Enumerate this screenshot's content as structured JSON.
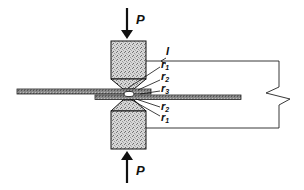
{
  "diagram": {
    "force_top_label": "P",
    "force_bottom_label": "P",
    "current_label": "I",
    "resistance_labels": [
      {
        "id": "r1_top",
        "text": "r",
        "sub": "1"
      },
      {
        "id": "r2_top",
        "text": "r",
        "sub": "2"
      },
      {
        "id": "r3",
        "text": "r",
        "sub": "3"
      },
      {
        "id": "r2_bottom",
        "text": "r",
        "sub": "2"
      },
      {
        "id": "r1_bottom",
        "text": "r",
        "sub": "1"
      }
    ],
    "colors": {
      "stroke": "#111111",
      "electrode_fill": "#c8c8c8",
      "sheet_fill": "#8a8a8a",
      "nugget_fill": "#ffffff",
      "background": "#ffffff"
    }
  }
}
